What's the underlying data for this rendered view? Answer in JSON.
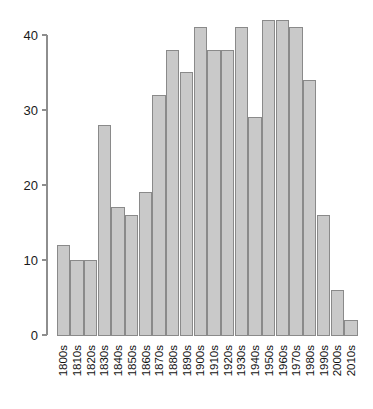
{
  "chart_data": {
    "type": "bar",
    "title": "",
    "subtitle": "",
    "xlabel": "",
    "ylabel": "",
    "categories": [
      "1800s",
      "1810s",
      "1820s",
      "1830s",
      "1840s",
      "1850s",
      "1860s",
      "1870s",
      "1880s",
      "1890s",
      "1900s",
      "1910s",
      "1920s",
      "1930s",
      "1940s",
      "1950s",
      "1960s",
      "1970s",
      "1980s",
      "1990s",
      "2000s",
      "2010s"
    ],
    "values": [
      12,
      10,
      10,
      28,
      17,
      16,
      19,
      32,
      38,
      35,
      41,
      38,
      38,
      41,
      29,
      42,
      42,
      41,
      34,
      16,
      6,
      2
    ],
    "ylim": [
      0,
      42
    ],
    "yticks": [
      0,
      10,
      20,
      30,
      40
    ],
    "ytick_labels": [
      "0",
      "10",
      "20",
      "30",
      "40"
    ],
    "xtick_rotation": 90,
    "grid": false,
    "legend": false,
    "bar_fill_color": "#c9c9c9",
    "bar_edge_color": "#8a8a8a",
    "axis_color": "#8e8e8e",
    "background_color": "#ffffff"
  },
  "axis": {
    "y_tick_labels": [
      "40",
      "30",
      "20",
      "10",
      "0"
    ]
  }
}
